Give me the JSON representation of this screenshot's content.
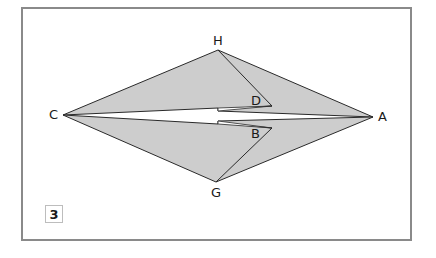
{
  "figure": {
    "step_number": "3",
    "colors": {
      "fill": "#cdcdcd",
      "stroke": "#2a2a2a",
      "frame": "#8a8a8a",
      "background": "#ffffff"
    },
    "points": {
      "C": {
        "label": "C",
        "x": 63,
        "y": 115
      },
      "A": {
        "label": "A",
        "x": 373,
        "y": 117
      },
      "H": {
        "label": "H",
        "x": 218,
        "y": 50
      },
      "G": {
        "label": "G",
        "x": 216,
        "y": 182
      },
      "D": {
        "label": "D",
        "x": 272,
        "y": 106
      },
      "B": {
        "label": "B",
        "x": 272,
        "y": 128
      }
    }
  }
}
